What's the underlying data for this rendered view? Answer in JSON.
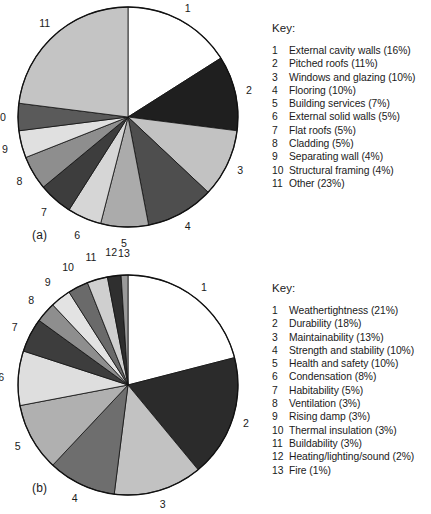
{
  "figure": {
    "panel_a_label": "(a)",
    "panel_b_label": "(b)",
    "key_title": "Key:"
  },
  "chart_data": [
    {
      "type": "pie",
      "panel": "(a)",
      "title": "",
      "legend_title": "Key:",
      "legend_position": "right",
      "start_angle": 0,
      "direction": "clockwise",
      "categories": [
        "External cavity walls",
        "Pitched roofs",
        "Windows and glazing",
        "Flooring",
        "Building services",
        "External solid walls",
        "Flat roofs",
        "Cladding",
        "Separating wall",
        "Structural framing",
        "Other"
      ],
      "values": [
        16,
        11,
        10,
        10,
        7,
        5,
        5,
        5,
        4,
        4,
        23
      ],
      "units": "%",
      "labels": [
        "1",
        "2",
        "3",
        "4",
        "5",
        "6",
        "7",
        "8",
        "9",
        "10",
        "11"
      ],
      "colors": [
        "#ffffff",
        "#1f1f1f",
        "#c2c2c2",
        "#4e4e4e",
        "#ababab",
        "#d6d6d6",
        "#3d3d3d",
        "#8e8e8e",
        "#e0e0e0",
        "#5a5a5a",
        "#c4c4c4"
      ],
      "legend_entries": [
        {
          "num": "1",
          "text": "External cavity walls (16%)"
        },
        {
          "num": "2",
          "text": "Pitched roofs (11%)"
        },
        {
          "num": "3",
          "text": "Windows and glazing (10%)"
        },
        {
          "num": "4",
          "text": "Flooring (10%)"
        },
        {
          "num": "5",
          "text": "Building services (7%)"
        },
        {
          "num": "6",
          "text": "External solid walls (5%)"
        },
        {
          "num": "7",
          "text": "Flat roofs (5%)"
        },
        {
          "num": "8",
          "text": "Cladding (5%)"
        },
        {
          "num": "9",
          "text": "Separating wall (4%)"
        },
        {
          "num": "10",
          "text": "Structural framing (4%)"
        },
        {
          "num": "11",
          "text": "Other (23%)"
        }
      ]
    },
    {
      "type": "pie",
      "panel": "(b)",
      "title": "",
      "legend_title": "Key:",
      "legend_position": "right",
      "start_angle": 0,
      "direction": "clockwise",
      "categories": [
        "Weathertightness",
        "Durability",
        "Maintainability",
        "Strength and stability",
        "Health and safety",
        "Condensation",
        "Habitability",
        "Ventilation",
        "Rising damp",
        "Thermal insulation",
        "Buildability",
        "Heating/lighting/sound",
        "Fire"
      ],
      "values": [
        21,
        18,
        13,
        10,
        10,
        8,
        5,
        3,
        3,
        3,
        3,
        2,
        1
      ],
      "units": "%",
      "labels": [
        "1",
        "2",
        "3",
        "4",
        "5",
        "6",
        "7",
        "8",
        "9",
        "10",
        "11",
        "12",
        "13"
      ],
      "colors": [
        "#ffffff",
        "#2b2b2b",
        "#c2c2c2",
        "#6e6e6e",
        "#b0b0b0",
        "#dedede",
        "#3d3d3d",
        "#8e8e8e",
        "#e3e3e3",
        "#6a6a6a",
        "#cfcfcf",
        "#2f2f2f",
        "#9a9a9a"
      ],
      "legend_entries": [
        {
          "num": "1",
          "text": "Weathertightness (21%)"
        },
        {
          "num": "2",
          "text": "Durability (18%)"
        },
        {
          "num": "3",
          "text": "Maintainability (13%)"
        },
        {
          "num": "4",
          "text": "Strength and stability (10%)"
        },
        {
          "num": "5",
          "text": "Health and safety (10%)"
        },
        {
          "num": "6",
          "text": "Condensation (8%)"
        },
        {
          "num": "7",
          "text": "Habitability (5%)"
        },
        {
          "num": "8",
          "text": "Ventilation (3%)"
        },
        {
          "num": "9",
          "text": "Rising damp (3%)"
        },
        {
          "num": "10",
          "text": "Thermal insulation (3%)"
        },
        {
          "num": "11",
          "text": "Buildability (3%)"
        },
        {
          "num": "12",
          "text": "Heating/lighting/sound (2%)"
        },
        {
          "num": "13",
          "text": "Fire (1%)"
        }
      ]
    }
  ]
}
